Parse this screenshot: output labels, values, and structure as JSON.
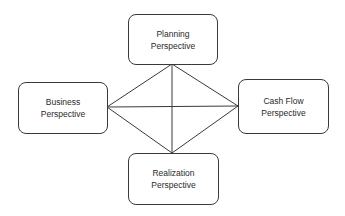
{
  "nodes": [
    {
      "id": "planning",
      "line1": "Planning",
      "line2": "Perspective"
    },
    {
      "id": "business",
      "line1": "Business",
      "line2": "Perspective"
    },
    {
      "id": "cashflow",
      "line1": "Cash Flow",
      "line2": "Perspective"
    },
    {
      "id": "realization",
      "line1": "Realization",
      "line2": "Perspective"
    }
  ],
  "edges": [
    [
      "planning",
      "business"
    ],
    [
      "planning",
      "cashflow"
    ],
    [
      "planning",
      "realization"
    ],
    [
      "business",
      "cashflow"
    ],
    [
      "business",
      "realization"
    ],
    [
      "cashflow",
      "realization"
    ]
  ],
  "colors": {
    "stroke": "#3a3a3a",
    "text": "#2a2a2a"
  }
}
